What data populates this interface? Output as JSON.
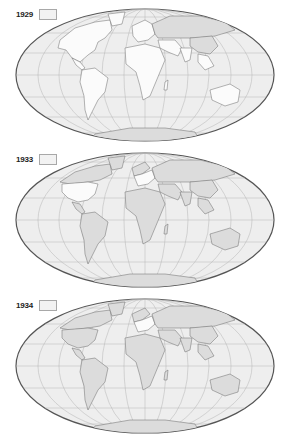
{
  "figure": {
    "projection": "equal-area pseudo-cylindrical (oval world map)",
    "colors": {
      "ocean": "#eeeeee",
      "land_white": "#fbfbfb",
      "land_shaded": "#dcdcdc",
      "border": "#6a6a6a",
      "graticule": "#b4b4b4",
      "outline": "#555555",
      "legend_swatch": "#f2f2f2"
    },
    "maps": [
      {
        "year": "1929",
        "legend_label": "1929",
        "shaded_regions": [
          "USSR",
          "China"
        ],
        "white_regions": [
          "North America",
          "South America",
          "Europe",
          "Africa",
          "India",
          "Australia"
        ]
      },
      {
        "year": "1933",
        "legend_label": "1933",
        "shaded_regions": [
          "Canada",
          "Latin America",
          "UK",
          "Scandinavia",
          "USSR",
          "China",
          "India",
          "Australia",
          "Japan"
        ],
        "white_regions": [
          "United States",
          "France",
          "Benelux",
          "Italy",
          "Switzerland",
          "Poland"
        ]
      },
      {
        "year": "1934",
        "legend_label": "1934",
        "shaded_regions": [
          "United States",
          "Canada",
          "Latin America",
          "UK",
          "Scandinavia",
          "USSR",
          "China",
          "India",
          "Australia",
          "Japan"
        ],
        "white_regions": [
          "France",
          "Benelux",
          "Switzerland",
          "Poland",
          "Italy"
        ]
      }
    ]
  }
}
